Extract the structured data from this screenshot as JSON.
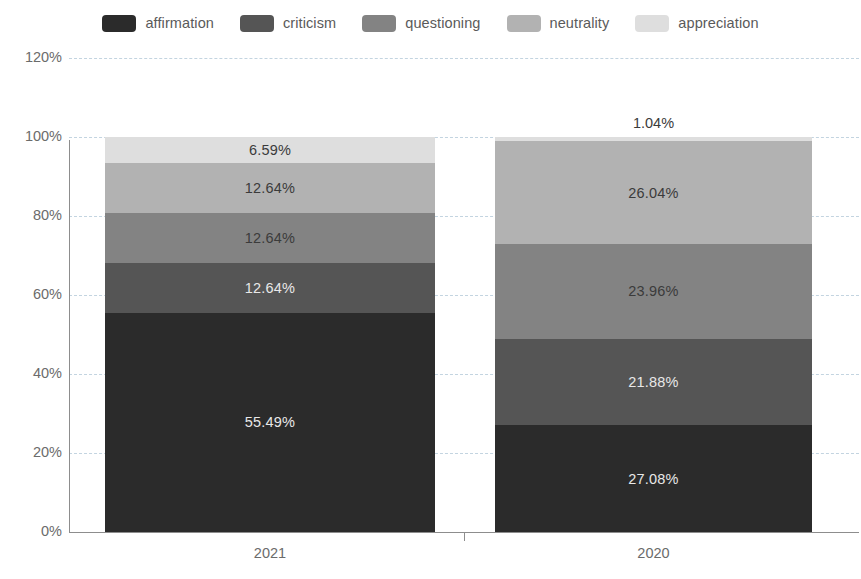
{
  "chart_data": {
    "type": "bar",
    "subtype": "stacked-percentage",
    "title": "",
    "xlabel": "",
    "ylabel": "",
    "categories": [
      "2021",
      "2020"
    ],
    "ylim": [
      0,
      120
    ],
    "yticks": [
      0,
      20,
      40,
      60,
      80,
      100,
      120
    ],
    "ytick_labels": [
      "0%",
      "20%",
      "40%",
      "60%",
      "80%",
      "100%",
      "120%"
    ],
    "grid": true,
    "legend_position": "top-center",
    "value_suffix": "%",
    "series": [
      {
        "name": "affirmation",
        "color": "#2b2b2b",
        "label_color": "#e8e8e8",
        "values": [
          55.49,
          27.08
        ],
        "labels": [
          "55.49%",
          "27.08%"
        ]
      },
      {
        "name": "criticism",
        "color": "#555555",
        "label_color": "#e8e8e8",
        "values": [
          12.64,
          21.88
        ],
        "labels": [
          "12.64%",
          "21.88%"
        ]
      },
      {
        "name": "questioning",
        "color": "#838383",
        "label_color": "#3b3b3b",
        "values": [
          12.64,
          23.96
        ],
        "labels": [
          "12.64%",
          "23.96%"
        ]
      },
      {
        "name": "neutrality",
        "color": "#b2b2b2",
        "label_color": "#3b3b3b",
        "values": [
          12.64,
          26.04
        ],
        "labels": [
          "12.64%",
          "26.04%"
        ]
      },
      {
        "name": "appreciation",
        "color": "#dedede",
        "label_color": "#3b3b3b",
        "values": [
          6.59,
          1.04
        ],
        "labels": [
          "6.59%",
          "1.04%"
        ]
      }
    ]
  },
  "legend": {
    "items": [
      {
        "label": "affirmation",
        "color": "#2b2b2b"
      },
      {
        "label": "criticism",
        "color": "#555555"
      },
      {
        "label": "questioning",
        "color": "#838383"
      },
      {
        "label": "neutrality",
        "color": "#b2b2b2"
      },
      {
        "label": "appreciation",
        "color": "#dedede"
      }
    ]
  },
  "axes": {
    "y_tick_labels": [
      "120%",
      "100%",
      "80%",
      "60%",
      "40%",
      "20%",
      "0%"
    ],
    "x_tick_labels": [
      "2021",
      "2020"
    ],
    "grid_color": "#c3d4e0",
    "axis_color": "#8d8d8d"
  }
}
